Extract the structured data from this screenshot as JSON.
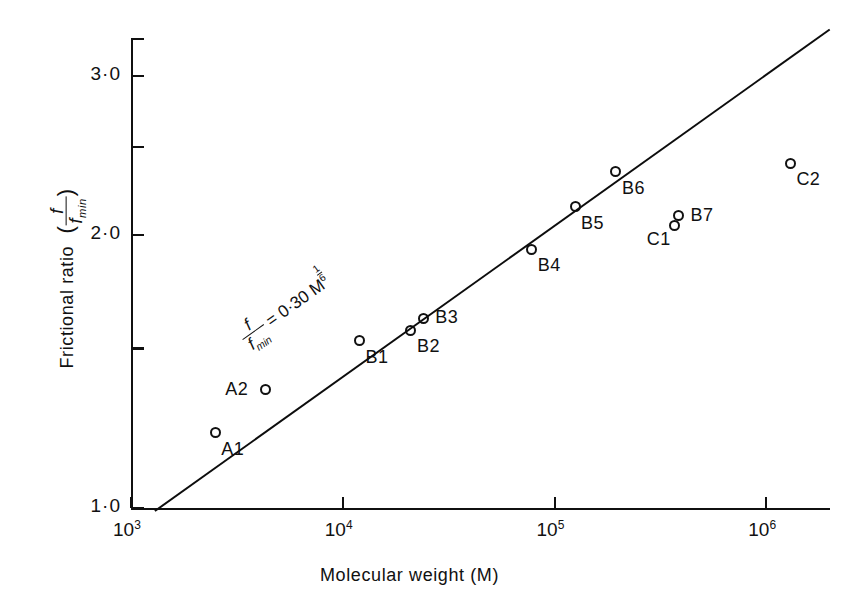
{
  "chart_data": {
    "type": "scatter",
    "title": "",
    "xlabel": "Molecular  weight   (M)",
    "ylabel_main": "Frictional   ratio",
    "ylabel_ratio_num": "f",
    "ylabel_ratio_den": "f",
    "ylabel_ratio_den_sub": "min",
    "xscale": "log",
    "yscale": "log",
    "xlim": [
      1000,
      2000000
    ],
    "ylim": [
      1.0,
      3.3
    ],
    "grid": false,
    "legend": "none",
    "xticks": [
      {
        "value": 1000,
        "mantissa": "10",
        "exponent": "3"
      },
      {
        "value": 10000,
        "mantissa": "10",
        "exponent": "4"
      },
      {
        "value": 100000,
        "mantissa": "10",
        "exponent": "5"
      },
      {
        "value": 1000000,
        "mantissa": "10",
        "exponent": "6"
      }
    ],
    "yticks": [
      {
        "value": 1.0,
        "label": "1·0"
      },
      {
        "value": 1.5,
        "label": ""
      },
      {
        "value": 2.0,
        "label": "2·0"
      },
      {
        "value": 2.5,
        "label": ""
      },
      {
        "value": 3.0,
        "label": "3·0"
      }
    ],
    "fit_line": {
      "equation_lhs_num": "f",
      "equation_lhs_den": "f",
      "equation_lhs_den_sub": "min",
      "equation_rhs": "= 0·30 M",
      "exponent_numerator": "1",
      "exponent_denominator": "6",
      "coefficient": 0.3,
      "power": 0.1667,
      "x_start": 1300,
      "x_end": 2000000
    },
    "points": [
      {
        "label": "A1",
        "x": 2500,
        "y": 1.21,
        "label_pos": "below-right"
      },
      {
        "label": "A2",
        "x": 4300,
        "y": 1.35,
        "label_pos": "left"
      },
      {
        "label": "B1",
        "x": 12000,
        "y": 1.53,
        "label_pos": "below-right"
      },
      {
        "label": "B2",
        "x": 21000,
        "y": 1.57,
        "label_pos": "below-right"
      },
      {
        "label": "B3",
        "x": 24000,
        "y": 1.62,
        "label_pos": "right"
      },
      {
        "label": "B4",
        "x": 78000,
        "y": 1.93,
        "label_pos": "below-right"
      },
      {
        "label": "B5",
        "x": 125000,
        "y": 2.15,
        "label_pos": "below-right"
      },
      {
        "label": "B6",
        "x": 195000,
        "y": 2.35,
        "label_pos": "below-right"
      },
      {
        "label": "B7",
        "x": 385000,
        "y": 2.1,
        "label_pos": "right"
      },
      {
        "label": "C1",
        "x": 370000,
        "y": 2.05,
        "label_pos": "below-left"
      },
      {
        "label": "C2",
        "x": 1300000,
        "y": 2.4,
        "label_pos": "below-right"
      }
    ]
  },
  "geometry": {
    "plot_left": 131,
    "plot_right": 830,
    "plot_top": 38,
    "plot_bottom": 508,
    "axis_color": "#101010"
  }
}
